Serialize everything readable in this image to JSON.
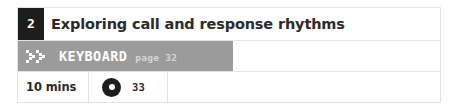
{
  "card": {
    "lesson_number": "2",
    "title": "Exploring call and response rhythms",
    "resource": {
      "icon": "double-chevron-icon",
      "label": "KEYBOARD",
      "page": "page 32",
      "band_color": "#9b9b9b"
    },
    "meta": {
      "duration": "10 mins",
      "track_icon": "disc-icon",
      "track_number": "33"
    },
    "colors": {
      "number_box": "#1d1d1d",
      "text": "#2b2b2b",
      "border": "#e2e2e2",
      "band": "#9b9b9b",
      "band_text": "#ffffff",
      "band_subtext": "#d6d6d6"
    }
  }
}
